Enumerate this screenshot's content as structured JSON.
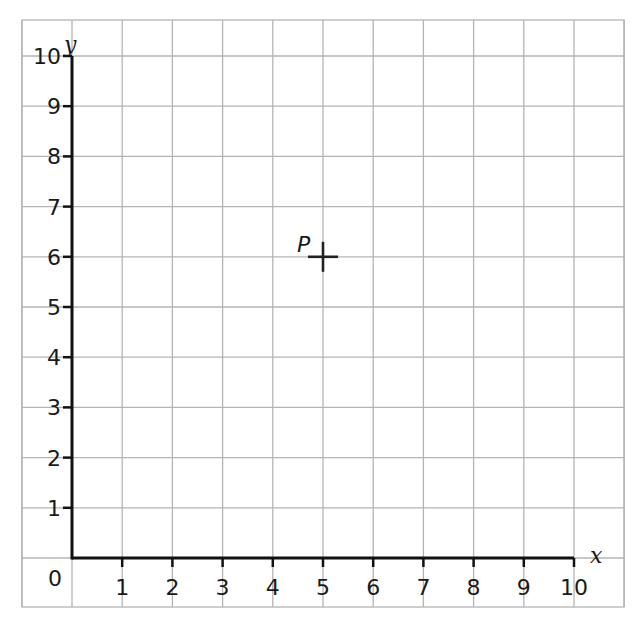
{
  "chart_data": {
    "type": "scatter",
    "title": "",
    "xlabel": "x",
    "ylabel": "y",
    "xlim": [
      0,
      10
    ],
    "ylim": [
      0,
      10
    ],
    "grid": true,
    "x_ticks": [
      "1",
      "2",
      "3",
      "4",
      "5",
      "6",
      "7",
      "8",
      "9",
      "10"
    ],
    "y_ticks": [
      "1",
      "2",
      "3",
      "4",
      "5",
      "6",
      "7",
      "8",
      "9",
      "10"
    ],
    "origin_label": "0",
    "points": [
      {
        "label": "P",
        "x": 5,
        "y": 6,
        "marker": "plus"
      }
    ]
  },
  "colors": {
    "grid": "#b4b4b4",
    "axis": "#111111",
    "text": "#1a1a1a"
  }
}
